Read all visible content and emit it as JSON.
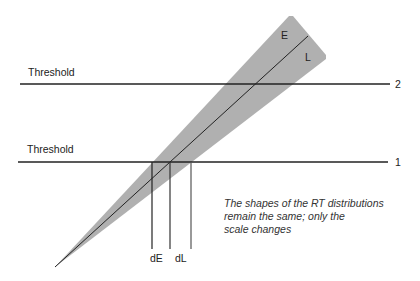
{
  "diagram": {
    "thresholds": [
      {
        "label": "Threshold",
        "number": "2",
        "y": 84
      },
      {
        "label": "Threshold",
        "number": "1",
        "y": 162
      }
    ],
    "wedge": {
      "upper_label": "E",
      "lower_label": "L",
      "fill": "#b0b0b0"
    },
    "markers": [
      {
        "label": "dE"
      },
      {
        "label": "dL"
      }
    ],
    "note_lines": [
      "The shapes of the RT distributions",
      "remain the same; only the",
      "scale changes"
    ]
  }
}
